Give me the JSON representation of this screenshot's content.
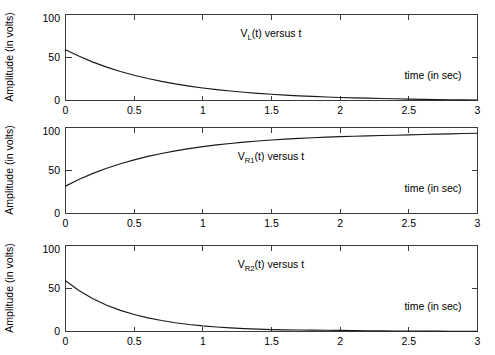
{
  "figure": {
    "background_color": "#ffffff",
    "axis_color": "#3b3b3b",
    "curve_color": "#1a1a1a",
    "width": 495,
    "height": 355
  },
  "panels": [
    {
      "name": "panel-vl",
      "title_main": "V",
      "title_sub": "L",
      "title_rest": "(t) versus t",
      "ylabel": "Amplitude (in volts)",
      "xlabel_inline": "time (in sec)",
      "ytick_labels": [
        "0",
        "50",
        "100"
      ],
      "xtick_labels": [
        "0",
        "0.5",
        "1",
        "1.5",
        "2",
        "2.5",
        "3"
      ]
    },
    {
      "name": "panel-vr1",
      "title_main": "V",
      "title_sub": "R1",
      "title_rest": "(t) versus t",
      "ylabel": "Amplitude (in volts)",
      "xlabel_inline": "time (in sec)",
      "ytick_labels": [
        "0",
        "50",
        "100"
      ],
      "xtick_labels": [
        "0",
        "0.5",
        "1",
        "1.5",
        "2",
        "2.5",
        "3"
      ]
    },
    {
      "name": "panel-vr2",
      "title_main": "V",
      "title_sub": "R2",
      "title_rest": "(t) versus t",
      "ylabel": "Amplitude (in volts)",
      "xlabel_inline": "time (in sec)",
      "ytick_labels": [
        "0",
        "50",
        "100"
      ],
      "xtick_labels": [
        "0",
        "0.5",
        "1",
        "1.5",
        "2",
        "2.5",
        "3"
      ]
    }
  ],
  "chart_data": [
    {
      "type": "line",
      "title": "V_L(t) versus t",
      "xlabel": "time (in sec)",
      "ylabel": "Amplitude (in volts)",
      "xlim": [
        0,
        3
      ],
      "ylim": [
        0,
        110
      ],
      "xticks": [
        0,
        0.5,
        1,
        1.5,
        2,
        2.5,
        3
      ],
      "yticks": [
        0,
        50,
        100
      ],
      "grid": false,
      "legend": "none",
      "series": [
        {
          "name": "V_L(t)",
          "x": [
            0,
            0.1,
            0.2,
            0.3,
            0.4,
            0.5,
            0.6,
            0.7,
            0.8,
            0.9,
            1.0,
            1.1,
            1.2,
            1.3,
            1.4,
            1.5,
            1.6,
            1.7,
            1.8,
            1.9,
            2.0,
            2.1,
            2.2,
            2.3,
            2.4,
            2.5,
            2.6,
            2.7,
            2.8,
            2.9,
            3.0
          ],
          "y": [
            65.0,
            56.5,
            49.1,
            42.7,
            37.1,
            32.3,
            28.1,
            24.4,
            21.2,
            18.4,
            16.0,
            13.9,
            12.1,
            10.5,
            9.2,
            8.0,
            6.9,
            6.0,
            5.2,
            4.5,
            3.9,
            3.4,
            3.0,
            2.6,
            2.3,
            1.8,
            1.5,
            1.2,
            1.0,
            0.8,
            0.6
          ]
        }
      ]
    },
    {
      "type": "line",
      "title": "V_R1(t) versus t",
      "xlabel": "time (in sec)",
      "ylabel": "Amplitude (in volts)",
      "xlim": [
        0,
        3
      ],
      "ylim": [
        0,
        110
      ],
      "xticks": [
        0,
        0.5,
        1,
        1.5,
        2,
        2.5,
        3
      ],
      "yticks": [
        0,
        50,
        100
      ],
      "grid": false,
      "legend": "none",
      "series": [
        {
          "name": "V_R1(t)",
          "x": [
            0,
            0.1,
            0.2,
            0.3,
            0.4,
            0.5,
            0.6,
            0.7,
            0.8,
            0.9,
            1.0,
            1.1,
            1.2,
            1.3,
            1.4,
            1.5,
            1.6,
            1.7,
            1.8,
            1.9,
            2.0,
            2.1,
            2.2,
            2.3,
            2.4,
            2.5,
            2.6,
            2.7,
            2.8,
            2.9,
            3.0
          ],
          "y": [
            35.0,
            43.7,
            51.3,
            57.9,
            63.6,
            68.6,
            73.0,
            76.8,
            80.1,
            83.0,
            85.5,
            87.7,
            89.6,
            91.3,
            92.7,
            94.0,
            95.1,
            96.1,
            96.9,
            97.6,
            98.3,
            98.8,
            99.3,
            99.7,
            100.1,
            100.6,
            101.1,
            101.5,
            101.9,
            102.3,
            102.7
          ]
        }
      ]
    },
    {
      "type": "line",
      "title": "V_R2(t) versus t",
      "xlabel": "time (in sec)",
      "ylabel": "Amplitude (in volts)",
      "xlim": [
        0,
        3
      ],
      "ylim": [
        0,
        110
      ],
      "xticks": [
        0,
        0.5,
        1,
        1.5,
        2,
        2.5,
        3
      ],
      "yticks": [
        0,
        50,
        100
      ],
      "grid": false,
      "legend": "none",
      "series": [
        {
          "name": "V_R2(t)",
          "x": [
            0,
            0.1,
            0.2,
            0.3,
            0.4,
            0.5,
            0.6,
            0.7,
            0.8,
            0.9,
            1.0,
            1.1,
            1.2,
            1.3,
            1.4,
            1.5,
            1.6,
            1.7,
            1.8,
            1.9,
            2.0,
            2.1,
            2.2,
            2.3,
            2.4,
            2.5,
            2.6,
            2.7,
            2.8,
            2.9,
            3.0
          ],
          "y": [
            65.0,
            52.2,
            41.9,
            33.6,
            27.0,
            21.7,
            17.4,
            14.0,
            11.2,
            9.0,
            7.2,
            5.8,
            4.7,
            3.7,
            3.0,
            2.4,
            2.1,
            1.9,
            1.7,
            1.6,
            1.5,
            1.2,
            1.0,
            0.8,
            0.7,
            0.6,
            0.5,
            0.4,
            0.3,
            0.3,
            0.2
          ]
        }
      ]
    }
  ]
}
